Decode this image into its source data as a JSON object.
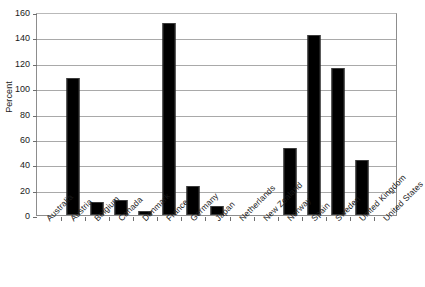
{
  "chart_data": {
    "type": "bar",
    "title": "",
    "xlabel": "",
    "ylabel": "Percent",
    "ylim": [
      0,
      160
    ],
    "ytick_step": 20,
    "yticks": [
      0,
      20,
      40,
      60,
      80,
      100,
      120,
      140,
      160
    ],
    "grid": true,
    "legend": false,
    "bar_color": "#000000",
    "gridline_color": "#a9a9a9",
    "axis_color": "#8d8d8d",
    "categories": [
      "Australia",
      "Austria",
      "Belgium",
      "Canada",
      "Denmark",
      "France",
      "Germany",
      "Japan",
      "Netherlands",
      "New Zealand",
      "Norway",
      "Spain",
      "Sweden",
      "United Kingdom",
      "United States"
    ],
    "values": [
      0,
      108,
      10,
      12,
      3,
      151,
      23,
      7,
      0,
      0,
      53,
      142,
      116,
      43,
      0
    ]
  }
}
